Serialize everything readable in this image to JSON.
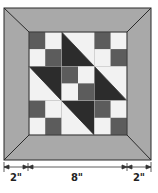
{
  "diagram": {
    "colors": {
      "border": "#a9a9a9",
      "dark": "#2c2c2c",
      "medium": "#5c5c5c",
      "light": "#f2f2f2",
      "outline": "#2a2a2a",
      "dimension": "#333333"
    },
    "block_layout": [
      [
        "four-patch",
        "hst-dark-lower-left",
        "four-patch"
      ],
      [
        "hst-dark-upper-right",
        "four-patch",
        "hst-dark-lower-left"
      ],
      [
        "four-patch",
        "hst-dark-upper-right",
        "four-patch"
      ]
    ],
    "dimensions": [
      {
        "label": "2\"",
        "segment": "left-border"
      },
      {
        "label": "8\"",
        "segment": "center-block"
      },
      {
        "label": "2\"",
        "segment": "right-border"
      }
    ]
  }
}
